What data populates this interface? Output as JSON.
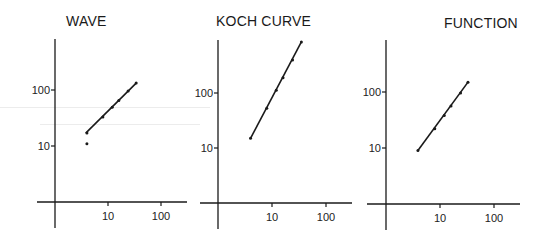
{
  "chart_data": [
    {
      "type": "scatter",
      "title": "WAVE",
      "xlabel": "",
      "ylabel": "",
      "xscale": "log",
      "yscale": "log",
      "x_ticks": [
        "10",
        "100"
      ],
      "y_ticks": [
        "10",
        "100"
      ],
      "xlim": [
        1,
        300
      ],
      "ylim": [
        1,
        1000
      ],
      "grid": false,
      "series": [
        {
          "name": "fit line",
          "style": "line",
          "x": [
            3.8,
            34
          ],
          "y": [
            17,
            133
          ]
        },
        {
          "name": "measured",
          "style": "points",
          "x": [
            4,
            4,
            8,
            12,
            16,
            24,
            34
          ],
          "y": [
            11,
            17,
            33,
            49,
            65,
            96,
            133
          ]
        }
      ]
    },
    {
      "type": "scatter",
      "title": "KOCH CURVE",
      "xlabel": "",
      "ylabel": "",
      "xscale": "log",
      "yscale": "log",
      "x_ticks": [
        "10",
        "100"
      ],
      "y_ticks": [
        "10",
        "100"
      ],
      "xlim": [
        1,
        300
      ],
      "ylim": [
        1,
        1000
      ],
      "grid": false,
      "series": [
        {
          "name": "fit line",
          "style": "line",
          "x": [
            4,
            35
          ],
          "y": [
            15,
            850
          ]
        },
        {
          "name": "measured",
          "style": "points",
          "x": [
            4,
            8,
            12,
            16,
            24,
            35
          ],
          "y": [
            15,
            53,
            112,
            190,
            400,
            850
          ]
        }
      ]
    },
    {
      "type": "scatter",
      "title": "FUNCTION",
      "xlabel": "",
      "ylabel": "",
      "xscale": "log",
      "yscale": "log",
      "x_ticks": [
        "10",
        "100"
      ],
      "y_ticks": [
        "10",
        "100"
      ],
      "xlim": [
        1,
        300
      ],
      "ylim": [
        1,
        1000
      ],
      "grid": false,
      "series": [
        {
          "name": "fit line",
          "style": "line",
          "x": [
            3.9,
            33
          ],
          "y": [
            9,
            150
          ]
        },
        {
          "name": "measured",
          "style": "points",
          "x": [
            3.9,
            8,
            12,
            16,
            24,
            33
          ],
          "y": [
            9,
            22,
            38,
            56,
            96,
            150
          ]
        }
      ]
    }
  ],
  "panels": [
    {
      "title": "WAVE"
    },
    {
      "title": "KOCH CURVE"
    },
    {
      "title": "FUNCTION"
    }
  ],
  "colors": {
    "ink": "#1a1a1a",
    "background": "#ffffff"
  }
}
